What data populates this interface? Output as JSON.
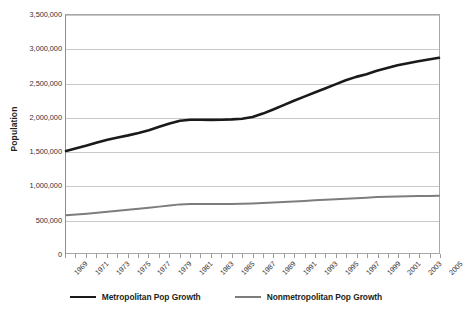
{
  "chart_data": {
    "type": "line",
    "title": "",
    "xlabel": "",
    "ylabel": "Population",
    "ylim": [
      0,
      3500000
    ],
    "grid": true,
    "legend_position": "bottom",
    "y_ticks": [
      "0",
      "500,000",
      "1,000,000",
      "1,500,000",
      "2,000,000",
      "2,500,000",
      "3,000,000",
      "3,500,000"
    ],
    "y_tick_values": [
      0,
      500000,
      1000000,
      1500000,
      2000000,
      2500000,
      3000000,
      3500000
    ],
    "categories": [
      "1969",
      "1970",
      "1971",
      "1972",
      "1973",
      "1974",
      "1975",
      "1976",
      "1977",
      "1978",
      "1979",
      "1980",
      "1981",
      "1982",
      "1983",
      "1984",
      "1985",
      "1986",
      "1987",
      "1988",
      "1989",
      "1990",
      "1991",
      "1992",
      "1993",
      "1994",
      "1995",
      "1996",
      "1997",
      "1998",
      "1999",
      "2000",
      "2001",
      "2002",
      "2003",
      "2004",
      "2005"
    ],
    "tick_labels": [
      "1969",
      "1971",
      "1973",
      "1975",
      "1977",
      "1979",
      "1981",
      "1983",
      "1985",
      "1987",
      "1989",
      "1991",
      "1993",
      "1995",
      "1997",
      "1999",
      "2001",
      "2003",
      "2005"
    ],
    "series": [
      {
        "name": "Metropolitan Pop Growth",
        "color": "#1a1a1a",
        "values": [
          1500000,
          1540000,
          1580000,
          1625000,
          1665000,
          1700000,
          1730000,
          1765000,
          1805000,
          1855000,
          1905000,
          1945000,
          1960000,
          1960000,
          1958000,
          1960000,
          1965000,
          1975000,
          2000000,
          2050000,
          2110000,
          2175000,
          2240000,
          2300000,
          2360000,
          2420000,
          2480000,
          2540000,
          2590000,
          2630000,
          2680000,
          2720000,
          2760000,
          2790000,
          2820000,
          2845000,
          2870000
        ]
      },
      {
        "name": "Nonmetropolitan Pop Growth",
        "color": "#7d7d7d",
        "values": [
          555000,
          565000,
          578000,
          592000,
          605000,
          620000,
          635000,
          650000,
          665000,
          682000,
          700000,
          715000,
          722000,
          722000,
          721000,
          721000,
          722000,
          724000,
          728000,
          735000,
          742000,
          750000,
          758000,
          766000,
          774000,
          782000,
          790000,
          798000,
          806000,
          814000,
          822000,
          828000,
          832000,
          835000,
          838000,
          840000,
          842000
        ]
      }
    ]
  },
  "legend": {
    "items": [
      {
        "label": "Metropolitan Pop Growth",
        "swatch": "metro-line-swatch"
      },
      {
        "label": "Nonmetropolitan Pop Growth",
        "swatch": "nonmetro-line-swatch"
      }
    ]
  }
}
